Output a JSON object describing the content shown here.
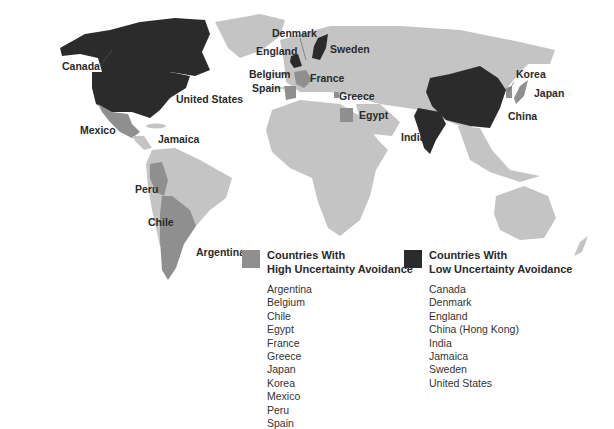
{
  "colors": {
    "high": "#8f8f8f",
    "low": "#2b2b2b",
    "other": "#c4c4c4",
    "background": "#ffffff"
  },
  "map_labels": {
    "canada": "Canada",
    "united_states": "United States",
    "mexico": "Mexico",
    "jamaica": "Jamaica",
    "peru": "Peru",
    "chile": "Chile",
    "argentina": "Argentina",
    "denmark": "Denmark",
    "england": "England",
    "sweden": "Sweden",
    "belgium": "Belgium",
    "france": "France",
    "spain": "Spain",
    "greece": "Greece",
    "egypt": "Egypt",
    "india": "India",
    "korea": "Korea",
    "japan": "Japan",
    "china": "China"
  },
  "legend": {
    "high": {
      "title_line1": "Countries With",
      "title_line2": "High Uncertainty Avoidance",
      "countries": [
        "Argentina",
        "Belgium",
        "Chile",
        "Egypt",
        "France",
        "Greece",
        "Japan",
        "Korea",
        "Mexico",
        "Peru",
        "Spain"
      ]
    },
    "low": {
      "title_line1": "Countries With",
      "title_line2": "Low Uncertainty Avoidance",
      "countries": [
        "Canada",
        "Denmark",
        "England",
        "China (Hong Kong)",
        "India",
        "Jamaica",
        "Sweden",
        "United States"
      ]
    }
  }
}
